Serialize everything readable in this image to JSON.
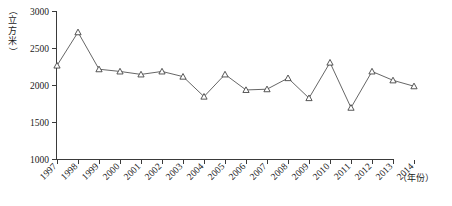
{
  "chart_data": {
    "type": "line",
    "title": "",
    "xlabel": "（年份）",
    "ylabel": "（立方米）",
    "ylim": [
      1000,
      3000
    ],
    "yticks": [
      1000,
      1500,
      2000,
      2500,
      3000
    ],
    "ytick_labels": [
      "1000",
      "1500",
      "2000",
      "2500",
      "3000"
    ],
    "grid": false,
    "legend": "none",
    "marker": "triangle-open",
    "categories": [
      "1997",
      "1998",
      "1999",
      "2000",
      "2001",
      "2002",
      "2003",
      "2004",
      "2005",
      "2006",
      "2007",
      "2008",
      "2009",
      "2010",
      "2011",
      "2012",
      "2013",
      "2014"
    ],
    "x": [
      1997,
      1998,
      1999,
      2000,
      2001,
      2002,
      2003,
      2004,
      2005,
      2006,
      2007,
      2008,
      2009,
      2010,
      2011,
      2012,
      2013,
      2014
    ],
    "values": [
      2270,
      2720,
      2220,
      2190,
      2150,
      2190,
      2120,
      1850,
      2150,
      1940,
      1950,
      2100,
      1830,
      2310,
      1700,
      2190,
      2070,
      1990
    ],
    "series": [
      {
        "name": "人均水资源量",
        "values": [
          2270,
          2720,
          2220,
          2190,
          2150,
          2190,
          2120,
          1850,
          2150,
          1940,
          1950,
          2100,
          1830,
          2310,
          1700,
          2190,
          2070,
          1990
        ]
      }
    ]
  },
  "axis_labels": {
    "y_unit_chars": [
      "立",
      "方",
      "米"
    ],
    "y_unit_open_paren": "（",
    "y_unit_close_paren": "）",
    "x_unit": "（年份）"
  },
  "colors": {
    "line": "#555555",
    "marker_stroke": "#444444",
    "marker_fill": "#ffffff",
    "axis": "#3a3a3a",
    "text": "#1a1a1a",
    "background": "#ffffff"
  }
}
